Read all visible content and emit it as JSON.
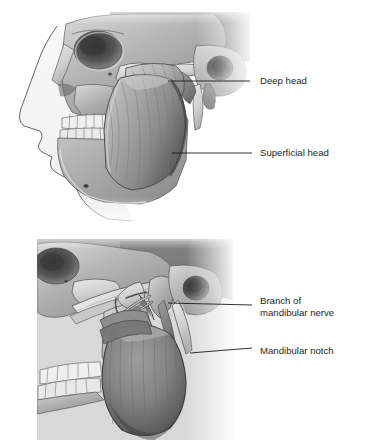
{
  "figure": {
    "type": "anatomical-illustration",
    "style": "grayscale pencil/airbrush medical illustration",
    "background_color": "#ffffff",
    "text_color": "#252525",
    "leader_line_color": "#1c1c1c"
  },
  "panels": [
    {
      "id": "upper",
      "name": "superficial-dissection-panel",
      "description": "Lateral view of skull with intact masseter muscle showing deep and superficial heads",
      "bounds": {
        "x": 18,
        "y": 10,
        "width": 232,
        "height": 212
      },
      "structures": [
        "frontal bone",
        "orbit",
        "nasal bones",
        "nasal profile outline",
        "zygomatic bone",
        "zygomatic arch",
        "maxilla with upper teeth",
        "mandible with lower teeth",
        "mental foramen",
        "external acoustic meatus",
        "mastoid process",
        "styloid process",
        "masseter muscle (deep head)",
        "masseter muscle (superficial head)"
      ]
    },
    {
      "id": "lower",
      "name": "deep-dissection-panel",
      "description": "Lateral view with masseter reflected inferiorly exposing mandibular notch and nerve branch",
      "bounds": {
        "x": 37,
        "y": 239,
        "width": 196,
        "height": 200
      },
      "structures": [
        "orbit",
        "zygomatic bone",
        "cut zygomatic arch",
        "maxilla with upper teeth",
        "mandible with lower teeth",
        "coronoid process",
        "condylar process",
        "mandibular notch",
        "external acoustic meatus",
        "styloid process",
        "branch of mandibular nerve (masseteric nerve)",
        "reflected masseter muscle"
      ]
    }
  ],
  "labels": [
    {
      "id": "deep-head",
      "text": "Deep head",
      "lines": [
        "Deep head"
      ],
      "text_x": 260,
      "text_y": 81,
      "leader": {
        "x1": 250,
        "y1": 81,
        "x2": 168,
        "y2": 81
      },
      "panel": "upper"
    },
    {
      "id": "superficial-head",
      "text": "Superficial head",
      "lines": [
        "Superficial head"
      ],
      "text_x": 260,
      "text_y": 153,
      "leader": {
        "x1": 252,
        "y1": 153,
        "x2": 172,
        "y2": 153
      },
      "panel": "upper"
    },
    {
      "id": "branch-of-mandibular-nerve",
      "text": "Branch of mandibular nerve",
      "lines": [
        "Branch of",
        "mandibular nerve"
      ],
      "text_x": 260,
      "text_y": 301,
      "leader": {
        "x1": 252,
        "y1": 305,
        "x2": 168,
        "y2": 303
      },
      "panel": "lower"
    },
    {
      "id": "mandibular-notch",
      "text": "Mandibular notch",
      "lines": [
        "Mandibular notch"
      ],
      "text_x": 260,
      "text_y": 351,
      "leader": {
        "x1": 252,
        "y1": 348,
        "x2": 190,
        "y2": 353
      },
      "panel": "lower"
    }
  ]
}
